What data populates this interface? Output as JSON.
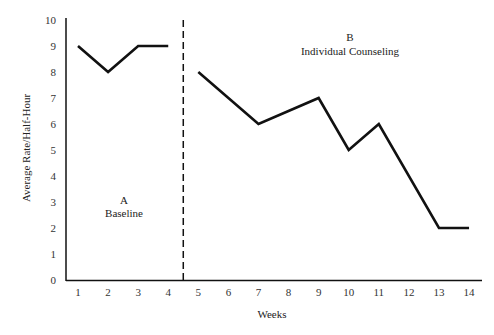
{
  "chart_data": {
    "type": "line",
    "title": "",
    "xlabel": "Weeks",
    "ylabel": "Average Rate/Half-Hour",
    "xlim": [
      1,
      14
    ],
    "ylim": [
      0,
      10
    ],
    "x_ticks": [
      1,
      2,
      3,
      4,
      5,
      6,
      7,
      8,
      9,
      10,
      11,
      12,
      13,
      14
    ],
    "y_ticks": [
      0,
      1,
      2,
      3,
      4,
      5,
      6,
      7,
      8,
      9,
      10
    ],
    "grid": false,
    "legend": null,
    "phase_change_line": {
      "x": 4.5,
      "style": "dashed"
    },
    "phases": [
      {
        "letter": "A",
        "name": "Baseline"
      },
      {
        "letter": "B",
        "name": "Individual Counseling"
      }
    ],
    "series": [
      {
        "name": "Baseline",
        "x": [
          1,
          2,
          3,
          4
        ],
        "values": [
          9,
          8,
          9,
          9
        ]
      },
      {
        "name": "Individual Counseling",
        "x": [
          5,
          7,
          9,
          10,
          11,
          13,
          14
        ],
        "values": [
          8,
          6,
          7,
          5,
          6,
          2,
          2
        ]
      }
    ]
  }
}
